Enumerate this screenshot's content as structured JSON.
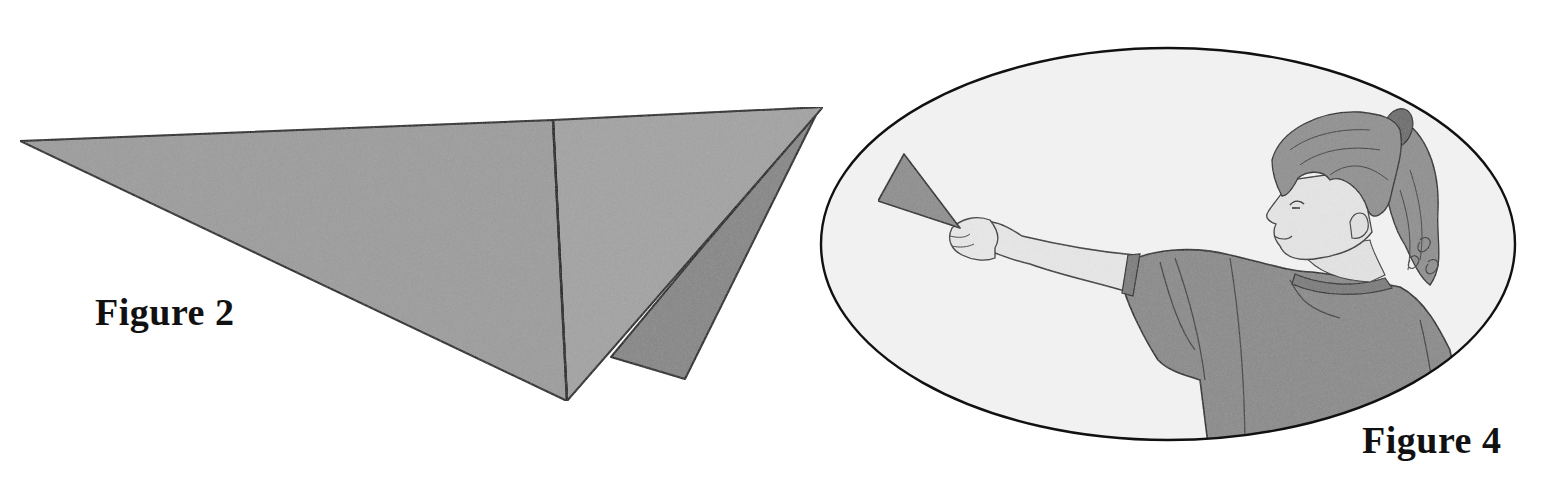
{
  "figures": [
    {
      "id": "figure-2",
      "caption": "Figure 2",
      "depicts": "folded paper triangle",
      "colors": {
        "paper_front": "#9a9a9a",
        "paper_back": "#858585",
        "outline": "#1a1a1a"
      }
    },
    {
      "id": "figure-4",
      "caption": "Figure 4",
      "depicts": "girl holding a paper cone at arm's length",
      "colors": {
        "oval_fill": "#f1f1f1",
        "oval_outline": "#111111",
        "skin": "#e6e6e6",
        "shirt": "#8a8a8a",
        "hair": "#8c8c8c",
        "cone": "#8e8e8e"
      }
    }
  ]
}
